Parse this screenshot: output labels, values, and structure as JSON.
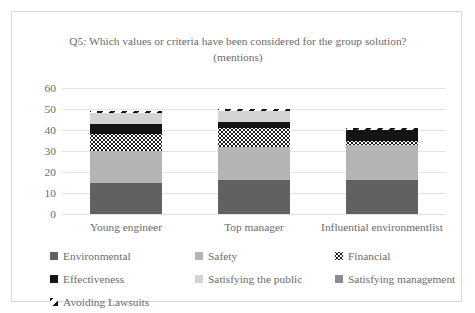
{
  "chart_data": {
    "type": "bar",
    "subtype": "stacked-bar",
    "title": "Q5: Which values or criteria have been considered for the group solution? (mentions)",
    "xlabel": "",
    "ylabel": "",
    "ylim": [
      0,
      60
    ],
    "yticks": [
      0,
      10,
      20,
      30,
      40,
      50,
      60
    ],
    "grid": true,
    "legend_position": "bottom",
    "categories": [
      "Young engineer",
      "Top manager",
      "Influential environmentlist"
    ],
    "series": [
      {
        "name": "Environmental",
        "color": "#616161",
        "pattern": "solid",
        "values": [
          15,
          16,
          16
        ]
      },
      {
        "name": "Safety",
        "color": "#b4b4b4",
        "pattern": "solid",
        "values": [
          15,
          16,
          17
        ]
      },
      {
        "name": "Financial",
        "color": "#1a1a1a",
        "pattern": "dotted",
        "values": [
          8,
          9,
          2
        ]
      },
      {
        "name": "Effectiveness",
        "color": "#141414",
        "pattern": "solid",
        "values": [
          5,
          3,
          5
        ]
      },
      {
        "name": "Satisfying the public",
        "color": "#d4d4d4",
        "pattern": "solid",
        "values": [
          5,
          5,
          0
        ]
      },
      {
        "name": "Satisfying management",
        "color": "#8c8c8c",
        "pattern": "solid",
        "values": [
          0,
          0,
          0
        ]
      },
      {
        "name": "Avoiding Lawsuits",
        "color": "#151515",
        "pattern": "diagonal-stripes",
        "values": [
          1,
          1,
          1
        ]
      }
    ],
    "totals": [
      49,
      50,
      41
    ]
  },
  "axis": {
    "tick_0": "0",
    "tick_10": "10",
    "tick_20": "20",
    "tick_30": "30",
    "tick_40": "40",
    "tick_50": "50",
    "tick_60": "60"
  },
  "legend": {
    "items": [
      {
        "label": "Environmental"
      },
      {
        "label": "Safety"
      },
      {
        "label": "Financial"
      },
      {
        "label": "Effectiveness"
      },
      {
        "label": "Satisfying the public"
      },
      {
        "label": "Satisfying management"
      },
      {
        "label": "Avoiding Lawsuits"
      }
    ]
  }
}
